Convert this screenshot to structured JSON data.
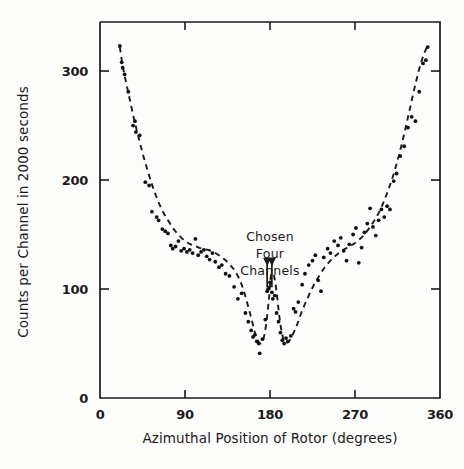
{
  "chart_data": {
    "type": "scatter",
    "title": "",
    "xlabel": "Azimuthal Position of Rotor (degrees)",
    "ylabel": "Counts per Channel in 2000 seconds",
    "xlim": [
      0,
      360
    ],
    "ylim": [
      0,
      345
    ],
    "grid": false,
    "legend": null,
    "x_ticks": [
      0,
      90,
      180,
      270,
      360
    ],
    "x_tick_labels": [
      "0",
      "90",
      "180",
      "270",
      "360"
    ],
    "y_ticks": [
      0,
      100,
      200,
      300
    ],
    "y_tick_labels": [
      "0",
      "100",
      "200",
      "300"
    ],
    "annotations": [
      {
        "text_lines": [
          "Chosen",
          "Four",
          "Channels"
        ],
        "x": 180,
        "y": 150,
        "marker": "double-down-arrow-bracket",
        "arrow_x": [
          177,
          182
        ],
        "arrow_target_y": 122
      }
    ],
    "series": [
      {
        "name": "fitted curve",
        "type": "line",
        "style": "dashed",
        "color": "#1a1a1a",
        "x": [
          21,
          24,
          28,
          32,
          36,
          40,
          45,
          50,
          55,
          60,
          66,
          72,
          78,
          84,
          90,
          96,
          102,
          108,
          114,
          120,
          126,
          132,
          138,
          144,
          150,
          155,
          160,
          164,
          167,
          170,
          173,
          176,
          179,
          181,
          184,
          187,
          190,
          193,
          196,
          200,
          204,
          209,
          214,
          220,
          226,
          232,
          238,
          244,
          250,
          256,
          262,
          268,
          274,
          280,
          286,
          292,
          298,
          304,
          310,
          316,
          322,
          328,
          334,
          340,
          346
        ],
        "y": [
          322,
          305,
          288,
          272,
          256,
          242,
          225,
          210,
          196,
          184,
          172,
          163,
          155,
          149,
          144,
          141,
          139,
          137,
          136,
          134,
          131,
          127,
          122,
          115,
          104,
          90,
          74,
          60,
          53,
          50,
          54,
          68,
          92,
          112,
          113,
          97,
          74,
          58,
          51,
          52,
          58,
          68,
          80,
          92,
          103,
          112,
          120,
          126,
          131,
          135,
          138,
          141,
          145,
          150,
          157,
          165,
          175,
          188,
          203,
          221,
          242,
          265,
          288,
          308,
          322
        ]
      },
      {
        "name": "measured counts",
        "type": "scatter",
        "marker": "dot",
        "color": "#111111",
        "points": [
          [
            21,
            323
          ],
          [
            23,
            308
          ],
          [
            24,
            303
          ],
          [
            26,
            297
          ],
          [
            30,
            281
          ],
          [
            35,
            250
          ],
          [
            37,
            254
          ],
          [
            38,
            244
          ],
          [
            42,
            241
          ],
          [
            48,
            198
          ],
          [
            52,
            195
          ],
          [
            55,
            171
          ],
          [
            60,
            166
          ],
          [
            62,
            163
          ],
          [
            66,
            155
          ],
          [
            69,
            153
          ],
          [
            72,
            151
          ],
          [
            75,
            140
          ],
          [
            77,
            137
          ],
          [
            80,
            139
          ],
          [
            83,
            144
          ],
          [
            86,
            135
          ],
          [
            89,
            137
          ],
          [
            92,
            134
          ],
          [
            95,
            136
          ],
          [
            98,
            133
          ],
          [
            101,
            146
          ],
          [
            104,
            131
          ],
          [
            107,
            134
          ],
          [
            110,
            136
          ],
          [
            113,
            130
          ],
          [
            116,
            127
          ],
          [
            119,
            133
          ],
          [
            122,
            125
          ],
          [
            126,
            120
          ],
          [
            129,
            122
          ],
          [
            133,
            114
          ],
          [
            137,
            112
          ],
          [
            142,
            102
          ],
          [
            146,
            91
          ],
          [
            150,
            96
          ],
          [
            154,
            78
          ],
          [
            157,
            70
          ],
          [
            160,
            62
          ],
          [
            162,
            56
          ],
          [
            164,
            58
          ],
          [
            166,
            52
          ],
          [
            168,
            50
          ],
          [
            169,
            41
          ],
          [
            172,
            54
          ],
          [
            175,
            72
          ],
          [
            177,
            98
          ],
          [
            178,
            100
          ],
          [
            180,
            106
          ],
          [
            182,
            97
          ],
          [
            183,
            91
          ],
          [
            185,
            94
          ],
          [
            187,
            78
          ],
          [
            189,
            70
          ],
          [
            191,
            60
          ],
          [
            193,
            53
          ],
          [
            195,
            50
          ],
          [
            197,
            55
          ],
          [
            199,
            52
          ],
          [
            202,
            57
          ],
          [
            205,
            82
          ],
          [
            207,
            79
          ],
          [
            210,
            88
          ],
          [
            214,
            104
          ],
          [
            217,
            114
          ],
          [
            221,
            122
          ],
          [
            225,
            126
          ],
          [
            228,
            131
          ],
          [
            231,
            108
          ],
          [
            234,
            98
          ],
          [
            237,
            129
          ],
          [
            241,
            137
          ],
          [
            244,
            133
          ],
          [
            248,
            144
          ],
          [
            252,
            140
          ],
          [
            255,
            147
          ],
          [
            258,
            135
          ],
          [
            261,
            126
          ],
          [
            264,
            141
          ],
          [
            268,
            150
          ],
          [
            271,
            156
          ],
          [
            274,
            124
          ],
          [
            277,
            138
          ],
          [
            280,
            152
          ],
          [
            283,
            160
          ],
          [
            286,
            174
          ],
          [
            289,
            157
          ],
          [
            292,
            149
          ],
          [
            295,
            163
          ],
          [
            298,
            173
          ],
          [
            301,
            166
          ],
          [
            304,
            176
          ],
          [
            307,
            173
          ],
          [
            311,
            199
          ],
          [
            314,
            206
          ],
          [
            318,
            222
          ],
          [
            322,
            231
          ],
          [
            326,
            248
          ],
          [
            330,
            258
          ],
          [
            334,
            254
          ],
          [
            338,
            281
          ],
          [
            342,
            307
          ],
          [
            345,
            310
          ],
          [
            347,
            322
          ]
        ]
      }
    ]
  }
}
